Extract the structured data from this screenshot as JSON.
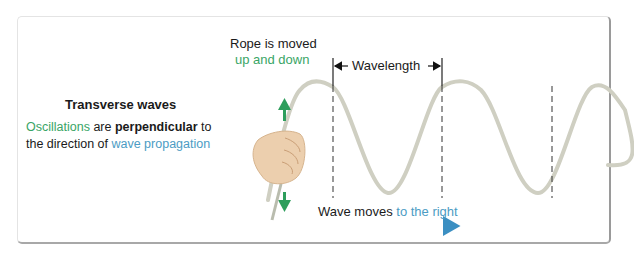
{
  "title": "Transverse waves",
  "description": {
    "part1": "Oscillations",
    "part2": " are ",
    "part3": "perpendicular",
    "part4": " to",
    "line2a": "the direction of ",
    "line2b": "wave propagation"
  },
  "rope_label": {
    "line1": "Rope is moved",
    "line2": "up and down"
  },
  "wavelength_label": "Wavelength",
  "wave_motion": {
    "part1": "Wave moves ",
    "part2": "to the right"
  },
  "colors": {
    "green": "#3aa566",
    "blue": "#4c9cc4",
    "wave": "#cfcfc2",
    "arrow_green": "#2e9e5c"
  }
}
